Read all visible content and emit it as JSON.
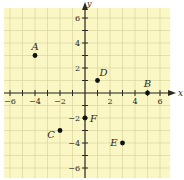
{
  "chart_data": {
    "type": "scatter",
    "title": "",
    "xlabel": "x",
    "ylabel": "y",
    "xlim": [
      -7,
      7
    ],
    "ylim": [
      -7,
      7
    ],
    "grid": true,
    "legend": null,
    "x_ticks": [
      -6,
      -4,
      -2,
      2,
      4,
      6
    ],
    "y_ticks": [
      6,
      4,
      2,
      -2,
      -4,
      -6
    ],
    "points": [
      {
        "label": "A",
        "x": -4,
        "y": 3
      },
      {
        "label": "B",
        "x": 5,
        "y": 0
      },
      {
        "label": "C",
        "x": -2,
        "y": -3
      },
      {
        "label": "D",
        "x": 1,
        "y": 1
      },
      {
        "label": "E",
        "x": 3,
        "y": -4
      },
      {
        "label": "F",
        "x": 0,
        "y": -2
      }
    ]
  },
  "colors": {
    "grid_background": "#fbf7c4",
    "grid_line": "#d8d4a0",
    "axis": "#2b2b22",
    "point": "#111111",
    "text": "#2b2b22"
  },
  "axis_labels": {
    "x": "x",
    "y": "y"
  }
}
